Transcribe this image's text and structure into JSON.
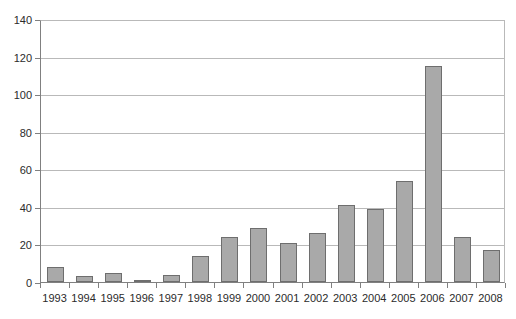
{
  "chart_data": {
    "type": "bar",
    "title": "",
    "xlabel": "",
    "ylabel": "",
    "categories": [
      "1993",
      "1994",
      "1995",
      "1996",
      "1997",
      "1998",
      "1999",
      "2000",
      "2001",
      "2002",
      "2003",
      "2004",
      "2005",
      "2006",
      "2007",
      "2008"
    ],
    "values": [
      8,
      3,
      5,
      1,
      4,
      14,
      24,
      29,
      21,
      26,
      41,
      39,
      54,
      115,
      24,
      17
    ],
    "series": [
      {
        "name": "",
        "values": [
          8,
          3,
          5,
          1,
          4,
          14,
          24,
          29,
          21,
          26,
          41,
          39,
          54,
          115,
          24,
          17
        ]
      }
    ],
    "ylim": [
      0,
      140
    ],
    "xlim_categories": 16,
    "yticks": [
      0,
      20,
      40,
      60,
      80,
      100,
      120,
      140
    ],
    "ytick_labels": [
      "0",
      "20",
      "40",
      "60",
      "80",
      "100",
      "120",
      "140"
    ],
    "grid": "horizontal",
    "legend": "none",
    "bar_color": "#a9a9a9",
    "bar_border_color": "#6e6e6e",
    "gridline_color": "#b9b9b9",
    "axis_color": "#808080",
    "background": "#ffffff"
  },
  "top_strip": {
    "clipped_text": ""
  }
}
